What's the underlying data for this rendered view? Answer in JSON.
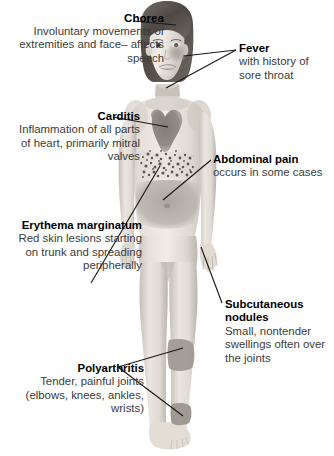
{
  "figure": {
    "markers": [
      {
        "name": "flushed-cheek",
        "region": "right cheek"
      },
      {
        "name": "heart-shading",
        "region": "central chest"
      },
      {
        "name": "rash-speckles",
        "region": "mid trunk band"
      },
      {
        "name": "abdomen-shading",
        "region": "lower abdomen"
      },
      {
        "name": "knee-patch",
        "region": "left knee"
      },
      {
        "name": "ankle-patch",
        "region": "left ankle"
      }
    ]
  },
  "callouts": {
    "chorea": {
      "title": "Chorea",
      "body": "Involuntary movements of extremities and face– affects speech"
    },
    "fever": {
      "title": "Fever",
      "body": "with history of sore throat"
    },
    "carditis": {
      "title": "Carditis",
      "body": "Inflammation of all parts of heart, primarily mitral valves"
    },
    "abdominal_pain": {
      "title": "Abdominal pain",
      "body": "occurs in some cases"
    },
    "erythema_marginatum": {
      "title": "Erythema marginatum",
      "body": "Red skin lesions starting on trunk and spreading peripherally"
    },
    "subcutaneous_nodules": {
      "title": "Subcutaneous nodules",
      "body": "Small, nontender swellings often over the joints"
    },
    "polyarthritis": {
      "title": "Polyarthritis",
      "body": "Tender, painful joints (elbows, knees, ankles, wrists)"
    }
  },
  "colors": {
    "background": "#ffffff",
    "heading_text": "#000000",
    "body_text": "#3b3b3b",
    "leader_line": "#1a1a1a",
    "skin_light": "#e9e4de",
    "skin_mid": "#d2ccc5",
    "skin_shadow": "#b5aea6",
    "marker_gray": "#a6a29c",
    "heart_dark": "#8d8882",
    "hair_dark": "#55504b"
  }
}
